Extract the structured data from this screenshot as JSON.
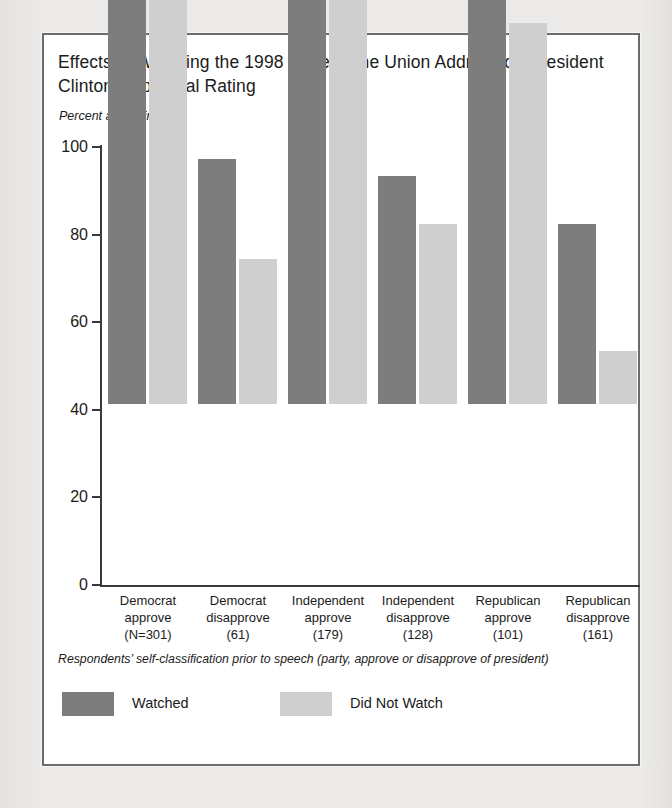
{
  "figure": {
    "title": "Effects of Watching the 1998 State of the Union Address on President Clinton’s Approval Rating",
    "axis_note": "Percent approving",
    "footnote": "Respondents’ self-classification prior to speech (party, approve or disapprove of president)"
  },
  "legend": {
    "items": [
      {
        "label": "Watched",
        "color": "#7d7d7d"
      },
      {
        "label": "Did Not Watch",
        "color": "#cfcfcf"
      }
    ]
  },
  "chart_data": {
    "type": "bar",
    "title": "Effects of Watching the 1998 State of the Union Address on President Clinton’s Approval Rating",
    "xlabel": "",
    "ylabel": "Percent approving",
    "ylim": [
      0,
      100
    ],
    "yticks": [
      0,
      20,
      40,
      60,
      80,
      100
    ],
    "ytick_labels": [
      "0",
      "20",
      "40",
      "60",
      "80",
      "100"
    ],
    "grid": false,
    "legend_position": "bottom-left",
    "categories": [
      "Democrat approve (N=301)",
      "Democrat disapprove (61)",
      "Independent approve (179)",
      "Independent disapprove (128)",
      "Republican approve (101)",
      "Republican disapprove (161)"
    ],
    "category_lines": [
      [
        "Democrat",
        "approve",
        "(N=301)"
      ],
      [
        "Democrat",
        "disapprove",
        "(61)"
      ],
      [
        "Independent",
        "approve",
        "(179)"
      ],
      [
        "Independent",
        "disapprove",
        "(128)"
      ],
      [
        "Republican",
        "approve",
        "(101)"
      ],
      [
        "Republican",
        "disapprove",
        "(161)"
      ]
    ],
    "sample_sizes": [
      301,
      61,
      179,
      128,
      101,
      161
    ],
    "series": [
      {
        "name": "Watched",
        "color": "#7d7d7d",
        "values": [
          99,
          56,
          100,
          52,
          93,
          41
        ]
      },
      {
        "name": "Did Not Watch",
        "color": "#cfcfcf",
        "values": [
          96,
          33,
          98,
          41,
          87,
          12
        ]
      }
    ]
  }
}
